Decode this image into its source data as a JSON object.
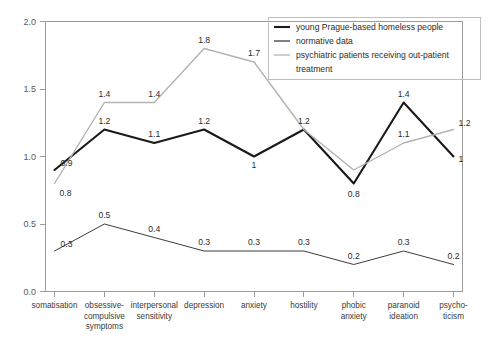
{
  "chart_data": {
    "type": "line",
    "title": "",
    "subtitle": "",
    "xlabel": "",
    "ylabel": "",
    "ylim": [
      0.0,
      2.0
    ],
    "ytick_labels": [
      "0.0",
      "0.5",
      "1.0",
      "1.5",
      "2.0"
    ],
    "ytick_values": [
      0.0,
      0.5,
      1.0,
      1.5,
      2.0
    ],
    "grid": false,
    "legend_position": "top-right",
    "categories": [
      "somatisation",
      "obsessive-compulsive symptoms",
      "interpersonal sensitivity",
      "depression",
      "anxiety",
      "hostility",
      "phobic anxiety",
      "paranoid ideation",
      "psychoticism"
    ],
    "category_lines": [
      [
        "somatisation"
      ],
      [
        "obsessive-",
        "compulsive",
        "symptoms"
      ],
      [
        "interpersonal",
        "sensitivity"
      ],
      [
        "depression"
      ],
      [
        "anxiety"
      ],
      [
        "hostility"
      ],
      [
        "phobic",
        "anxiety"
      ],
      [
        "paranoid",
        "ideation"
      ],
      [
        "psycho-",
        "ticism"
      ]
    ],
    "series": [
      {
        "name": "young Prague-based homeless people",
        "color": "#1a1a1a",
        "width": 2.1,
        "values": [
          0.9,
          1.2,
          1.1,
          1.2,
          1.0,
          1.2,
          0.8,
          1.4,
          1.0
        ],
        "labels": [
          "0.9",
          "1.2",
          "1.1",
          "1.2",
          "1",
          "1.2",
          "0.8",
          "1.4",
          "1"
        ]
      },
      {
        "name": "normative data",
        "color": "#3d3d3d",
        "width": 1.0,
        "values": [
          0.3,
          0.5,
          0.4,
          0.3,
          0.3,
          0.3,
          0.2,
          0.3,
          0.2
        ],
        "labels": [
          "0.3",
          "0.5",
          "0.4",
          "0.3",
          "0.3",
          "0.3",
          "0.2",
          "0.3",
          "0.2"
        ]
      },
      {
        "name": "psychiatric patients receiving out-patient treatment",
        "color": "#b3b3b3",
        "width": 1.4,
        "values": [
          0.8,
          1.4,
          1.4,
          1.8,
          1.7,
          1.2,
          0.9,
          1.1,
          1.2
        ],
        "labels": [
          "0.8",
          "1.4",
          "1.4",
          "1.8",
          "1.7",
          "",
          "",
          "1.1",
          "1.2"
        ]
      }
    ]
  },
  "legend": {
    "entries": [
      {
        "label": "young Prague-based homeless people",
        "label_line2": "",
        "color": "#1a1a1a",
        "width": 2.1
      },
      {
        "label": "normative data",
        "label_line2": "",
        "color": "#3d3d3d",
        "width": 1.3
      },
      {
        "label": "psychiatric patients receiving out-patient",
        "label_line2": "treatment",
        "color": "#b3b3b3",
        "width": 1.3
      }
    ]
  }
}
